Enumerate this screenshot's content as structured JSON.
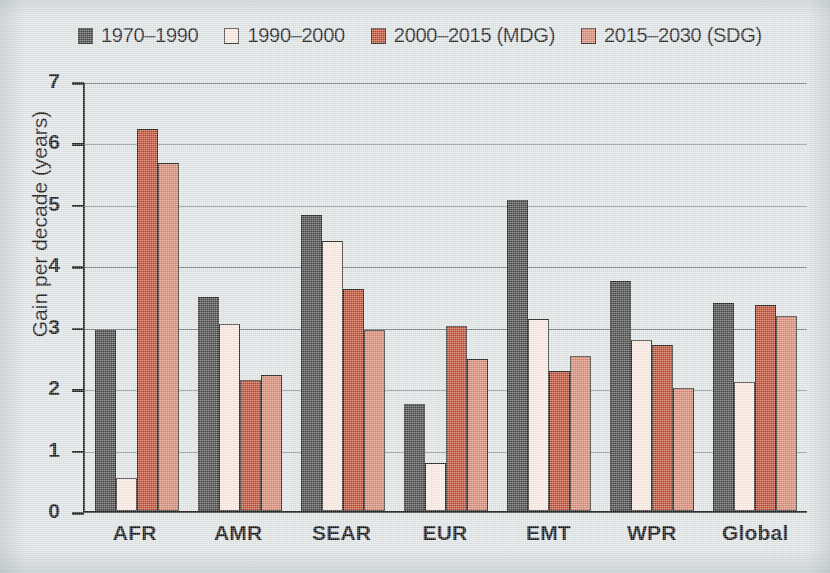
{
  "chart_data": {
    "type": "bar",
    "title": "",
    "xlabel": "",
    "ylabel": "Gain per decade (years)",
    "ylim": [
      0,
      7
    ],
    "ytick_labels": [
      "7",
      "6",
      "5",
      "4",
      "3",
      "2",
      "1",
      "0"
    ],
    "ytick_values": [
      7,
      6,
      5,
      4,
      3,
      2,
      1,
      0
    ],
    "grid": "horizontal",
    "legend_position": "top-left",
    "categories": [
      "AFR",
      "AMR",
      "SEAR",
      "EUR",
      "EMT",
      "WPR",
      "Global"
    ],
    "series": [
      {
        "name": "1970–1990",
        "color": "#464646",
        "values": [
          2.95,
          3.48,
          4.82,
          1.75,
          5.07,
          3.74,
          3.39
        ]
      },
      {
        "name": "1990–2000",
        "color": "#fbe7dd",
        "values": [
          0.54,
          3.04,
          4.39,
          0.78,
          3.13,
          2.79,
          2.1
        ]
      },
      {
        "name": "2000–2015 (MDG)",
        "color": "#c2472c",
        "values": [
          6.22,
          2.14,
          3.62,
          3.01,
          2.28,
          2.71,
          3.35
        ]
      },
      {
        "name": "2015–2030 (SDG)",
        "color": "#d9866e",
        "values": [
          5.67,
          2.21,
          2.95,
          2.48,
          2.52,
          2.0,
          3.17
        ]
      }
    ]
  },
  "legend": {
    "items": [
      {
        "label": "1970–1990",
        "color": "#464646",
        "swatch": "legend-swatch-1970-1990"
      },
      {
        "label": "1990–2000",
        "color": "#fbe7dd",
        "swatch": "legend-swatch-1990-2000"
      },
      {
        "label": "2000–2015 (MDG)",
        "color": "#c2472c",
        "swatch": "legend-swatch-mdg"
      },
      {
        "label": "2015–2030 (SDG)",
        "color": "#d9866e",
        "swatch": "legend-swatch-sdg"
      }
    ]
  },
  "colors": {
    "background": "#dfe4e5",
    "axis": "#1b1b1b",
    "gridline": "#7d8589",
    "bar_outline": "#20201f"
  }
}
